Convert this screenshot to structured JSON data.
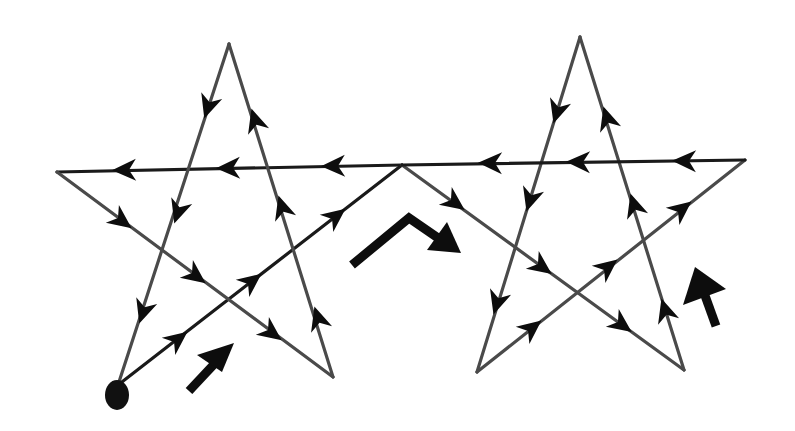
{
  "diagram": {
    "colors": {
      "background": "#ffffff",
      "edge": "#4a4a4a",
      "arrow": "#0d0d0d"
    },
    "start_point": {
      "x": 117,
      "y": 395,
      "label": ""
    },
    "stars": [
      {
        "name": "left-star",
        "vertices": {
          "top": [
            229,
            44
          ],
          "left": [
            57,
            172
          ],
          "right": [
            402,
            165
          ],
          "bottom_left": [
            118,
            385
          ],
          "bottom_right": [
            333,
            377
          ]
        }
      },
      {
        "name": "right-star",
        "vertices": {
          "top": [
            580,
            37
          ],
          "left": [
            402,
            165
          ],
          "right": [
            745,
            160
          ],
          "bottom_left": [
            477,
            372
          ],
          "bottom_right": [
            684,
            370
          ]
        }
      }
    ],
    "path_order": [
      "start(118,385) -> junction(402,165)",
      "junction(402,165) -> right-star bottom_right(684,370)",
      "right-star bottom_right -> right-star top",
      "right-star top -> right-star bottom_left",
      "right-star bottom_left -> right-star right",
      "right-star right -> junction",
      "junction -> left-star left",
      "left-star left -> left-star bottom_right",
      "left-star bottom_right -> left-star top",
      "left-star top -> left-star bottom_left"
    ],
    "indicator_arrows": [
      {
        "name": "lower-left-arrow",
        "direction": "north-east"
      },
      {
        "name": "center-chevron-arrow",
        "direction": "up-then-down-right"
      },
      {
        "name": "right-arrow",
        "direction": "north"
      }
    ]
  }
}
